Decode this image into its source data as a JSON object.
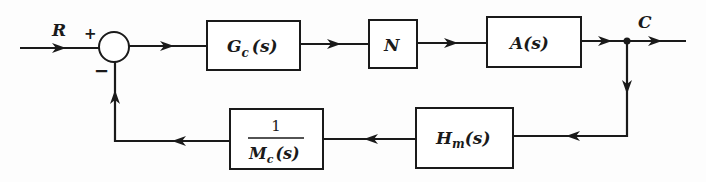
{
  "diagram": {
    "type": "feedback control block diagram",
    "input_signal": "R",
    "output_signal": "C",
    "summing_junction": {
      "plus_sign": "+",
      "minus_sign": "−"
    },
    "forward_path": [
      {
        "id": "gc",
        "label_main": "G",
        "label_sub": "c",
        "label_arg": "(s)"
      },
      {
        "id": "n",
        "label_main": "N"
      },
      {
        "id": "a",
        "label_main": "A",
        "label_arg": "(s)"
      }
    ],
    "feedback_path": [
      {
        "id": "hm",
        "label_main": "H",
        "label_sub": "m",
        "label_arg": "(s)"
      },
      {
        "id": "mc",
        "numerator": "1",
        "label_main": "M",
        "label_sub": "c",
        "label_arg": "(s)"
      }
    ],
    "colors": {
      "line": "#1a1a1a",
      "background": "#fdfdfd"
    }
  }
}
